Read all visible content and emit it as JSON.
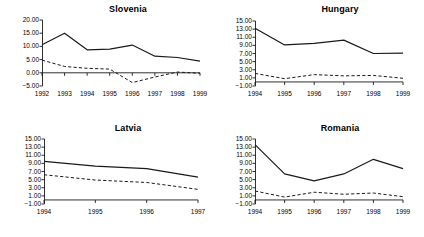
{
  "figure": {
    "layout": "2x2 grid of line charts",
    "background": "#ffffff",
    "line_color": "#1a1a1a"
  },
  "chart_data": [
    {
      "type": "line",
      "title": "Slovenia",
      "xlabel": "",
      "ylabel": "",
      "categories": [
        "1992",
        "1993",
        "1994",
        "1995",
        "1996",
        "1997",
        "1998",
        "1999"
      ],
      "yticks": [
        "-5.00",
        "0.00",
        "5.00",
        "10.00",
        "15.00",
        "20.00"
      ],
      "ylim": [
        -5,
        20
      ],
      "grid": false,
      "legend": "none",
      "series": [
        {
          "name": "solid",
          "style": "solid",
          "values": [
            10.6,
            15.0,
            8.7,
            9.0,
            10.5,
            6.3,
            5.8,
            4.4
          ]
        },
        {
          "name": "dashed",
          "style": "dashed",
          "values": [
            4.8,
            2.4,
            1.7,
            1.4,
            -3.7,
            -1.6,
            0.3,
            -0.2
          ]
        }
      ]
    },
    {
      "type": "line",
      "title": "Hungary",
      "xlabel": "",
      "ylabel": "",
      "categories": [
        "1994",
        "1995",
        "1996",
        "1997",
        "1998",
        "1999"
      ],
      "yticks": [
        "-1.00",
        "1.00",
        "3.00",
        "5.00",
        "7.00",
        "9.00",
        "11.00",
        "13.00",
        "15.00"
      ],
      "ylim": [
        -1,
        15
      ],
      "grid": false,
      "legend": "none",
      "series": [
        {
          "name": "solid",
          "style": "solid",
          "values": [
            13.2,
            9.1,
            9.5,
            10.3,
            7.0,
            7.1
          ]
        },
        {
          "name": "dashed",
          "style": "dashed",
          "values": [
            2.1,
            0.8,
            1.8,
            1.5,
            1.6,
            0.9
          ]
        }
      ]
    },
    {
      "type": "line",
      "title": "Latvia",
      "xlabel": "",
      "ylabel": "",
      "categories": [
        "1994",
        "1995",
        "1996",
        "1997"
      ],
      "yticks": [
        "-1.00",
        "1.00",
        "3.00",
        "5.00",
        "7.00",
        "9.00",
        "11.00",
        "13.00",
        "15.00"
      ],
      "ylim": [
        -1,
        15
      ],
      "grid": false,
      "legend": "none",
      "series": [
        {
          "name": "solid",
          "style": "solid",
          "values": [
            9.5,
            8.3,
            7.7,
            5.6
          ]
        },
        {
          "name": "dashed",
          "style": "dashed",
          "values": [
            6.2,
            4.9,
            4.3,
            2.6
          ]
        }
      ]
    },
    {
      "type": "line",
      "title": "Romania",
      "xlabel": "",
      "ylabel": "",
      "categories": [
        "1994",
        "1995",
        "1996",
        "1997",
        "1998",
        "1999"
      ],
      "yticks": [
        "-1.00",
        "1.00",
        "3.00",
        "5.00",
        "7.00",
        "9.00",
        "11.00",
        "13.00",
        "15.00"
      ],
      "ylim": [
        -1,
        15
      ],
      "grid": false,
      "legend": "none",
      "series": [
        {
          "name": "solid",
          "style": "solid",
          "values": [
            13.6,
            6.4,
            4.7,
            6.4,
            10.0,
            7.7
          ]
        },
        {
          "name": "dashed",
          "style": "dashed",
          "values": [
            2.2,
            0.7,
            1.9,
            1.4,
            1.7,
            0.8
          ]
        }
      ]
    }
  ]
}
